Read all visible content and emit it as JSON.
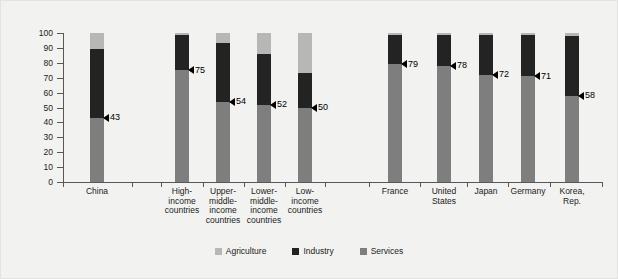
{
  "chart_data": {
    "type": "bar",
    "subtype": "stacked-column",
    "title": "",
    "xlabel": "",
    "ylabel": "% of GDP",
    "ylim": [
      0,
      100
    ],
    "yticks": [
      0,
      10,
      20,
      30,
      40,
      50,
      60,
      70,
      80,
      90,
      100
    ],
    "grid": false,
    "legend_position": "bottom-center",
    "categories": [
      "China",
      "High-income countries",
      "Upper-middle-income countries",
      "Lower-middle-income countries",
      "Low-income countries",
      "France",
      "United States",
      "Japan",
      "Germany",
      "Korea, Rep."
    ],
    "series": [
      {
        "name": "Services",
        "color": "#7e7e7e",
        "values": [
          43,
          75,
          54,
          52,
          50,
          79,
          78,
          72,
          71,
          58
        ]
      },
      {
        "name": "Industry",
        "color": "#232323",
        "values": [
          46,
          24,
          39,
          34,
          23,
          20,
          21,
          27,
          28,
          40
        ]
      },
      {
        "name": "Agriculture",
        "color": "#b7b7b5",
        "values": [
          11,
          1,
          7,
          14,
          27,
          1,
          1,
          1,
          1,
          2
        ]
      }
    ],
    "annotations": [
      {
        "category": "China",
        "value": 43,
        "label": "43"
      },
      {
        "category": "High-income countries",
        "value": 75,
        "label": "75"
      },
      {
        "category": "Upper-middle-income countries",
        "value": 54,
        "label": "54"
      },
      {
        "category": "Lower-middle-income countries",
        "value": 52,
        "label": "52"
      },
      {
        "category": "Low-income countries",
        "value": 50,
        "label": "50"
      },
      {
        "category": "France",
        "value": 79,
        "label": "79"
      },
      {
        "category": "United States",
        "value": 78,
        "label": "78"
      },
      {
        "category": "Japan",
        "value": 72,
        "label": "72"
      },
      {
        "category": "Germany",
        "value": 71,
        "label": "71"
      },
      {
        "category": "Korea, Rep.",
        "value": 58,
        "label": "58"
      }
    ]
  },
  "axis": {
    "y_label": "% of GDP",
    "y_ticks": [
      "100",
      "90",
      "80",
      "70",
      "60",
      "50",
      "40",
      "30",
      "20",
      "10",
      "0"
    ]
  },
  "x_labels": [
    {
      "lines": [
        "China"
      ]
    },
    {
      "lines": [
        "High-income",
        "countries"
      ]
    },
    {
      "lines": [
        "Upper-",
        "middle-",
        "income",
        "countries"
      ]
    },
    {
      "lines": [
        "Lower-",
        "middle-",
        "income",
        "countries"
      ]
    },
    {
      "lines": [
        "Low-",
        "income",
        "countries"
      ]
    },
    {
      "lines": [
        "France"
      ]
    },
    {
      "lines": [
        "United",
        "States"
      ]
    },
    {
      "lines": [
        "Japan"
      ]
    },
    {
      "lines": [
        "Germany"
      ]
    },
    {
      "lines": [
        "Korea,",
        "Rep."
      ]
    }
  ],
  "legend": {
    "items": [
      {
        "label": "Agriculture",
        "color": "#b7b7b5"
      },
      {
        "label": "Industry",
        "color": "#232323"
      },
      {
        "label": "Services",
        "color": "#7e7e7e"
      }
    ]
  },
  "colors": {
    "background": "#f2f2f0",
    "axis": "#58585a",
    "text": "#1c1c1c",
    "agriculture": "#b7b7b5",
    "industry": "#232323",
    "services": "#7e7e7e"
  }
}
